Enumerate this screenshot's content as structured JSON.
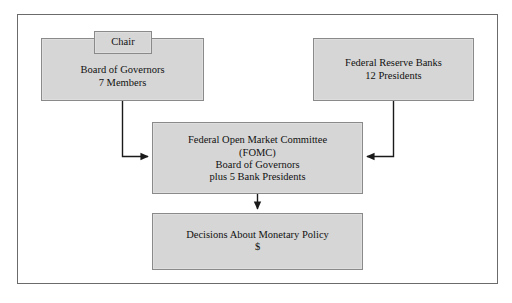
{
  "diagram": {
    "title_visible": false,
    "colors": {
      "box_fill": "#d6d6d6",
      "box_border": "#8a8a8a",
      "frame_border": "#6b6b6b",
      "connector": "#1a1a1a",
      "page_background": "#ffffff",
      "text": "#111111"
    },
    "nodes": [
      {
        "id": "chair",
        "name": "chair-box",
        "lines": [
          "Chair"
        ]
      },
      {
        "id": "board_of_governors",
        "name": "board-of-governors-box",
        "lines": [
          "Board of Governors",
          "7 Members"
        ]
      },
      {
        "id": "federal_reserve_banks",
        "name": "federal-reserve-banks-box",
        "lines": [
          "Federal Reserve Banks",
          "12 Presidents"
        ]
      },
      {
        "id": "fomc",
        "name": "fomc-box",
        "lines": [
          "Federal Open Market Committee",
          "(FOMC)",
          "Board of Governors",
          "plus 5 Bank Presidents"
        ]
      },
      {
        "id": "decisions",
        "name": "decisions-box",
        "lines": [
          "Decisions About Monetary Policy",
          "$"
        ]
      }
    ],
    "connectors": [
      {
        "id": "board_to_fomc",
        "from": "board_of_governors",
        "to": "fomc",
        "style": "elbow-down-right",
        "arrowhead": "right"
      },
      {
        "id": "banks_to_fomc",
        "from": "federal_reserve_banks",
        "to": "fomc",
        "style": "elbow-down-left",
        "arrowhead": "left"
      },
      {
        "id": "fomc_to_decisions",
        "from": "fomc",
        "to": "decisions",
        "style": "straight-down",
        "arrowhead": "down"
      }
    ]
  }
}
